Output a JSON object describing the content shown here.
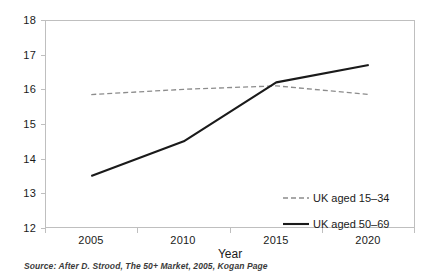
{
  "chart_data": {
    "type": "line",
    "title": "",
    "subtitle": "",
    "xlabel": "Year",
    "ylabel": "",
    "categories": [
      "2005",
      "2010",
      "2015",
      "2020"
    ],
    "x": [
      2005,
      2010,
      2015,
      2020
    ],
    "ylim": [
      12,
      18
    ],
    "yticks": [
      "12",
      "13",
      "14",
      "15",
      "16",
      "17",
      "18"
    ],
    "ytick_values": [
      12,
      13,
      14,
      15,
      16,
      17,
      18
    ],
    "grid": false,
    "legend_position": "inside-bottom-right",
    "series": [
      {
        "name": "UK aged 15–34",
        "values": [
          15.85,
          16.0,
          16.1,
          15.85
        ],
        "color": "#8c8c8c",
        "style": "dashed",
        "width": 1.3
      },
      {
        "name": "UK aged 50–69",
        "values": [
          13.5,
          14.5,
          16.2,
          16.7
        ],
        "color": "#1a1a1a",
        "style": "solid",
        "width": 2.1
      }
    ],
    "annotations": [],
    "source_note": "Source:  After D. Strood, The 50+ Market,  2005, Kogan Page"
  },
  "legend": {
    "items": [
      {
        "label": "UK aged 15–34"
      },
      {
        "label": "UK aged 50–69"
      }
    ]
  },
  "axes": {
    "x_title": "Year"
  },
  "colors": {
    "axis": "#bfbfbf",
    "text": "#1a1a1a",
    "series_young": "#8c8c8c",
    "series_older": "#1a1a1a",
    "background": "#ffffff"
  }
}
